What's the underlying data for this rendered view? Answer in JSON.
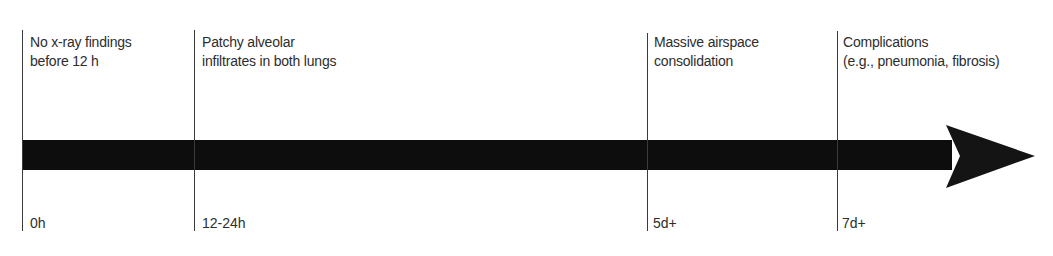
{
  "timeline": {
    "arrow_color": "#0d0d0d",
    "line_color": "#3a3a3a",
    "events": [
      {
        "time": "0h",
        "lines": [
          "No x-ray findings",
          "before 12 h"
        ]
      },
      {
        "time": "12-24h",
        "lines": [
          "Patchy alveolar",
          "infiltrates in both lungs"
        ]
      },
      {
        "time": "5d+",
        "lines": [
          "Massive airspace",
          "consolidation"
        ]
      },
      {
        "time": "7d+",
        "lines": [
          "Complications",
          "(e.g., pneumonia, fibrosis)"
        ]
      }
    ]
  }
}
